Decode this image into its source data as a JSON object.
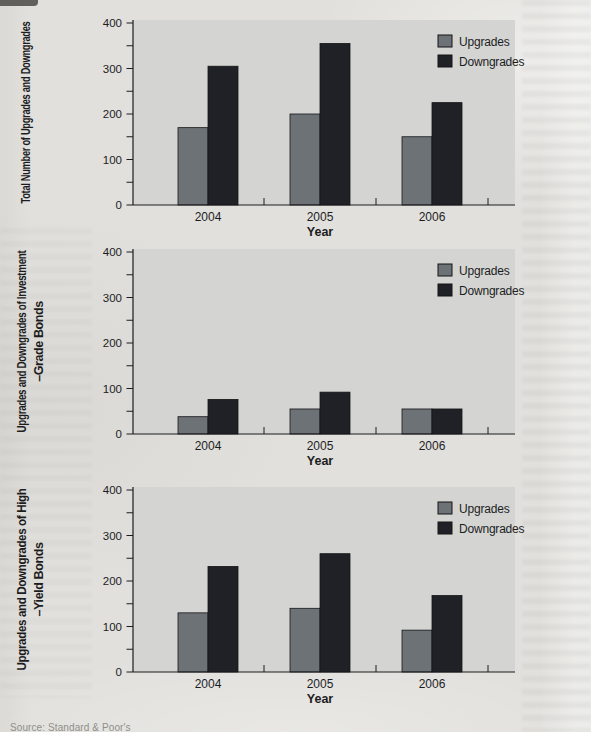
{
  "page": {
    "source_note": "Source: Standard & Poor's"
  },
  "colors": {
    "upgrades": "#6d7277",
    "downgrades": "#202127",
    "bar_outline": "#141417",
    "plot_bg": "#d4d5d2",
    "page_bg": "#e1e0dc",
    "axis": "#1c1c1e",
    "text": "#1d1d1f"
  },
  "chart_data": [
    {
      "type": "bar",
      "ylabel": "Total Number of Upgrades and Downgrades",
      "ylabel_lines": [
        "Total Number of Upgrades and Downgrades"
      ],
      "xlabel": "Year",
      "categories": [
        "2004",
        "2005",
        "2006"
      ],
      "series": [
        {
          "name": "Upgrades",
          "values": [
            170,
            200,
            150
          ]
        },
        {
          "name": "Downgrades",
          "values": [
            305,
            355,
            225
          ]
        }
      ],
      "ylim": [
        0,
        400
      ],
      "ytick_labels": [
        0,
        100,
        200,
        300,
        400
      ],
      "minor_tick_interval": 50,
      "grid": false,
      "legend_position": "top-right-inside"
    },
    {
      "type": "bar",
      "ylabel": "Upgrades and Downgrades of Investment –Grade Bonds",
      "ylabel_lines": [
        "Upgrades and Downgrades of Investment",
        "–Grade Bonds"
      ],
      "xlabel": "Year",
      "categories": [
        "2004",
        "2005",
        "2006"
      ],
      "series": [
        {
          "name": "Upgrades",
          "values": [
            38,
            55,
            55
          ]
        },
        {
          "name": "Downgrades",
          "values": [
            76,
            92,
            55
          ]
        }
      ],
      "ylim": [
        0,
        400
      ],
      "ytick_labels": [
        0,
        100,
        200,
        300,
        400
      ],
      "minor_tick_interval": 50,
      "grid": false,
      "legend_position": "top-right-inside"
    },
    {
      "type": "bar",
      "ylabel": "Upgrades and Downgrades of High –Yield Bonds",
      "ylabel_lines": [
        "Upgrades and Downgrades of High",
        "–Yield Bonds"
      ],
      "xlabel": "Year",
      "categories": [
        "2004",
        "2005",
        "2006"
      ],
      "series": [
        {
          "name": "Upgrades",
          "values": [
            130,
            140,
            92
          ]
        },
        {
          "name": "Downgrades",
          "values": [
            232,
            260,
            168
          ]
        }
      ],
      "ylim": [
        0,
        400
      ],
      "ytick_labels": [
        0,
        100,
        200,
        300,
        400
      ],
      "minor_tick_interval": 50,
      "grid": false,
      "legend_position": "top-right-inside"
    }
  ]
}
